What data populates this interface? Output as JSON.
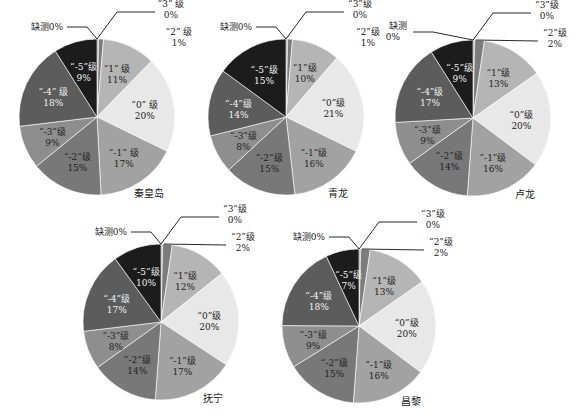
{
  "chart_data": [
    {
      "type": "pie",
      "title": "秦皇岛",
      "center": [
        97,
        117
      ],
      "radius": 78,
      "slices": [
        {
          "label": "“3” 级",
          "value": 0,
          "pct": "0%"
        },
        {
          "label": "“2” 级",
          "value": 1,
          "pct": "1%"
        },
        {
          "label": "“1” 级",
          "value": 11,
          "pct": "11%"
        },
        {
          "label": "“0” 级",
          "value": 20,
          "pct": "20%"
        },
        {
          "label": "“-1” 级",
          "value": 17,
          "pct": "17%"
        },
        {
          "label": "“-2”级",
          "value": 15,
          "pct": "15%"
        },
        {
          "label": "“-3”级",
          "value": 9,
          "pct": "9%"
        },
        {
          "label": "“-4” 级",
          "value": 18,
          "pct": "18%"
        },
        {
          "label": "“-5”级",
          "value": 9,
          "pct": "9%"
        },
        {
          "label": "缺测",
          "value": 0,
          "pct": "0%"
        }
      ]
    },
    {
      "type": "pie",
      "title": "青龙",
      "center": [
        286,
        117
      ],
      "radius": 78,
      "slices": [
        {
          "label": "“3”级",
          "value": 0,
          "pct": "0%"
        },
        {
          "label": "“2”级",
          "value": 1,
          "pct": "1%"
        },
        {
          "label": "“1”级",
          "value": 10,
          "pct": "10%"
        },
        {
          "label": "“0”级",
          "value": 21,
          "pct": "21%"
        },
        {
          "label": "“-1”级",
          "value": 16,
          "pct": "16%"
        },
        {
          "label": "“-2”级",
          "value": 15,
          "pct": "15%"
        },
        {
          "label": "“-3”级",
          "value": 8,
          "pct": "8%"
        },
        {
          "label": "“-4”级",
          "value": 14,
          "pct": "14%"
        },
        {
          "label": "“-5”级",
          "value": 15,
          "pct": "15%"
        },
        {
          "label": "缺测",
          "value": 0,
          "pct": "0%"
        }
      ]
    },
    {
      "type": "pie",
      "title": "卢龙",
      "center": [
        473,
        118
      ],
      "radius": 78,
      "slices": [
        {
          "label": "“3”级",
          "value": 0,
          "pct": "0%"
        },
        {
          "label": "“2”级",
          "value": 2,
          "pct": "2%"
        },
        {
          "label": "“1”级",
          "value": 13,
          "pct": "13%"
        },
        {
          "label": "“0”级",
          "value": 20,
          "pct": "20%"
        },
        {
          "label": "“-1”级",
          "value": 16,
          "pct": "16%"
        },
        {
          "label": "“-2”级",
          "value": 14,
          "pct": "14%"
        },
        {
          "label": "“-3”级",
          "value": 9,
          "pct": "9%"
        },
        {
          "label": "“-4”级",
          "value": 17,
          "pct": "17%"
        },
        {
          "label": "“-5”级",
          "value": 9,
          "pct": "9%"
        },
        {
          "label": "缺测",
          "value": 0,
          "pct": "0%"
        }
      ]
    },
    {
      "type": "pie",
      "title": "抚宁",
      "center": [
        161,
        322
      ],
      "radius": 78,
      "slices": [
        {
          "label": "“3”级",
          "value": 0,
          "pct": "0%"
        },
        {
          "label": "“2”级",
          "value": 2,
          "pct": "2%"
        },
        {
          "label": "“1”级",
          "value": 12,
          "pct": "12%"
        },
        {
          "label": "“0”级",
          "value": 20,
          "pct": "20%"
        },
        {
          "label": "“-1”级",
          "value": 17,
          "pct": "17%"
        },
        {
          "label": "“-2”级",
          "value": 14,
          "pct": "14%"
        },
        {
          "label": "“-3”级",
          "value": 8,
          "pct": "8%"
        },
        {
          "label": "“-4”级",
          "value": 17,
          "pct": "17%"
        },
        {
          "label": "“-5”级",
          "value": 10,
          "pct": "10%"
        },
        {
          "label": "缺测",
          "value": 0,
          "pct": "0%"
        }
      ]
    },
    {
      "type": "pie",
      "title": "昌黎",
      "center": [
        359,
        326
      ],
      "radius": 77,
      "slices": [
        {
          "label": "“3”级",
          "value": 0,
          "pct": "0%"
        },
        {
          "label": "“2”级",
          "value": 2,
          "pct": "2%"
        },
        {
          "label": "“1”级",
          "value": 13,
          "pct": "13%"
        },
        {
          "label": "“0”级",
          "value": 20,
          "pct": "20%"
        },
        {
          "label": "“-1”级",
          "value": 16,
          "pct": "16%"
        },
        {
          "label": "“-2”级",
          "value": 15,
          "pct": "15%"
        },
        {
          "label": "“-3”级",
          "value": 9,
          "pct": "9%"
        },
        {
          "label": "“-4”级",
          "value": 18,
          "pct": "18%"
        },
        {
          "label": "“-5”级",
          "value": 7,
          "pct": "7%"
        },
        {
          "label": "缺测",
          "value": 0,
          "pct": "0%"
        }
      ]
    }
  ],
  "colors": {
    "“3”": "#8a8a8a",
    "“2”": "#7c7c7c",
    "“1”": "#b5b5b5",
    "“0”": "#e8e8e8",
    "“-1”": "#a2a2a2",
    "“-2”": "#787878",
    "“-3”": "#8e8e8e",
    "“-4”": "#5c5c5c",
    "“-5”": "#1c1c1c",
    "缺测": "#444444"
  },
  "slice_colors": [
    "#8a8a8a",
    "#7c7c7c",
    "#b5b5b5",
    "#e8e8e8",
    "#a2a2a2",
    "#787878",
    "#8e8e8e",
    "#5c5c5c",
    "#1c1c1c",
    "#444444"
  ],
  "label_text_colors": [
    "#222222",
    "#222222",
    "#222222",
    "#222222",
    "#222222",
    "#222222",
    "#222222",
    "#f2f2f2",
    "#f2f2f2",
    "#222222"
  ]
}
